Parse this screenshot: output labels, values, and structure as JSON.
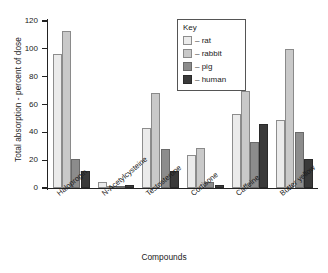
{
  "chart_data": {
    "type": "bar",
    "title": "",
    "xlabel": "Compounds",
    "ylabel": "Total absorption - percent of dose",
    "ylim": [
      0,
      120
    ],
    "yticks": [
      0,
      20,
      40,
      60,
      80,
      100,
      120
    ],
    "grid": false,
    "legend_position": "top-right",
    "legend_title": "Key",
    "categories": [
      "Haloprogin",
      "N-Acetylcysteine",
      "Testosterone",
      "Cortisone",
      "Caffeine",
      "Butter yellow"
    ],
    "series": [
      {
        "name": "rat",
        "color": "#ebebeb",
        "values": [
          96,
          4,
          43,
          24,
          53,
          49
        ]
      },
      {
        "name": "rabbit",
        "color": "#c9c9c9",
        "values": [
          113,
          1.5,
          68,
          29,
          70,
          100
        ]
      },
      {
        "name": "pig",
        "color": "#8c8c8c",
        "values": [
          21,
          0,
          28,
          4,
          33,
          40
        ]
      },
      {
        "name": "human",
        "color": "#3a3a3a",
        "values": [
          12,
          2,
          12,
          2.5,
          46,
          21
        ]
      }
    ]
  }
}
